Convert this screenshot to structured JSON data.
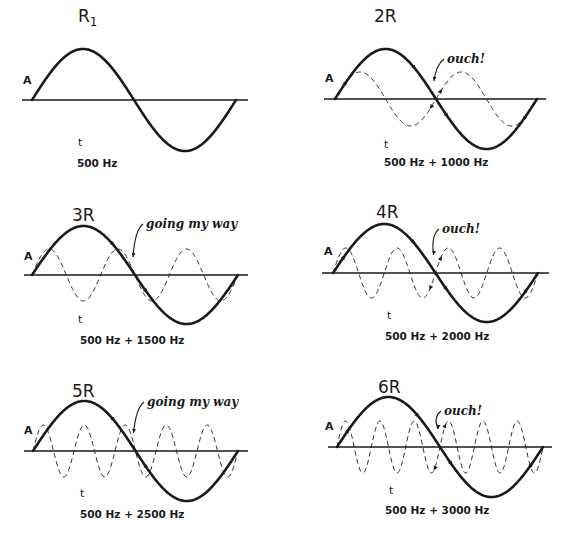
{
  "figure": {
    "background": "#ffffff",
    "ink_color": "#1a1a1a",
    "axis_labels": {
      "amplitude": "A",
      "time": "t"
    },
    "panels": [
      {
        "id": "r1",
        "title": "R",
        "title_subscript": "1",
        "frequency_label": "500 Hz",
        "fundamental_hz": 500,
        "harmonic_hz": null,
        "harmonic_multiple": 1,
        "annotation": "",
        "annotation_type": "none",
        "geometry": {
          "x0": 32,
          "x1": 236,
          "axis_y": 100,
          "axis_x0": 22,
          "axis_x1": 248,
          "amp": 51,
          "harm_amp": 0,
          "title_x": 78,
          "title_y": 22,
          "a_x": 23,
          "a_y": 84,
          "t_x": 78,
          "t_y": 146,
          "freq_x": 77,
          "freq_y": 167
        }
      },
      {
        "id": "r2",
        "title": "2R",
        "title_subscript": "",
        "frequency_label": "500 Hz + 1000 Hz",
        "fundamental_hz": 500,
        "harmonic_hz": 1000,
        "harmonic_multiple": 2,
        "annotation": "ouch!",
        "annotation_type": "opposing",
        "geometry": {
          "x0": 335,
          "x1": 537,
          "axis_y": 99,
          "axis_x0": 324,
          "axis_x1": 546,
          "amp": 50,
          "harm_amp": 27,
          "title_x": 374,
          "title_y": 22,
          "a_x": 325,
          "a_y": 82,
          "t_x": 384,
          "t_y": 148,
          "freq_x": 384,
          "freq_y": 166,
          "note_x": 447,
          "note_y": 63
        }
      },
      {
        "id": "r3",
        "title": "3R",
        "title_subscript": "",
        "frequency_label": "500 Hz + 1500 Hz",
        "fundamental_hz": 500,
        "harmonic_hz": 1500,
        "harmonic_multiple": 3,
        "annotation": "going my way",
        "annotation_type": "aligned",
        "geometry": {
          "x0": 32,
          "x1": 238,
          "axis_y": 275,
          "axis_x0": 24,
          "axis_x1": 248,
          "amp": 49,
          "harm_amp": 26,
          "title_x": 72,
          "title_y": 221,
          "a_x": 24,
          "a_y": 260,
          "t_x": 78,
          "t_y": 323,
          "freq_x": 80,
          "freq_y": 344,
          "note_x": 146,
          "note_y": 228
        }
      },
      {
        "id": "r4",
        "title": "4R",
        "title_subscript": "",
        "frequency_label": "500 Hz + 2000 Hz",
        "fundamental_hz": 500,
        "harmonic_hz": 2000,
        "harmonic_multiple": 4,
        "annotation": "ouch!",
        "annotation_type": "opposing",
        "geometry": {
          "x0": 333,
          "x1": 538,
          "axis_y": 273,
          "axis_x0": 322,
          "axis_x1": 549,
          "amp": 49,
          "harm_amp": 25,
          "title_x": 376,
          "title_y": 218,
          "a_x": 324,
          "a_y": 255,
          "t_x": 387,
          "t_y": 319,
          "freq_x": 385,
          "freq_y": 340,
          "note_x": 442,
          "note_y": 233
        }
      },
      {
        "id": "r5",
        "title": "5R",
        "title_subscript": "",
        "frequency_label": "500 Hz + 2500 Hz",
        "fundamental_hz": 500,
        "harmonic_hz": 2500,
        "harmonic_multiple": 5,
        "annotation": "going my way",
        "annotation_type": "aligned",
        "geometry": {
          "x0": 33,
          "x1": 238,
          "axis_y": 451,
          "axis_x0": 24,
          "axis_x1": 248,
          "amp": 50,
          "harm_amp": 26,
          "title_x": 72,
          "title_y": 397,
          "a_x": 24,
          "a_y": 434,
          "t_x": 80,
          "t_y": 497,
          "freq_x": 80,
          "freq_y": 518,
          "note_x": 147,
          "note_y": 406
        }
      },
      {
        "id": "r6",
        "title": "6R",
        "title_subscript": "",
        "frequency_label": "500 Hz + 3000 Hz",
        "fundamental_hz": 500,
        "harmonic_hz": 3000,
        "harmonic_multiple": 6,
        "annotation": "ouch!",
        "annotation_type": "opposing",
        "geometry": {
          "x0": 337,
          "x1": 543,
          "axis_y": 447,
          "axis_x0": 328,
          "axis_x1": 552,
          "amp": 50,
          "harm_amp": 26,
          "title_x": 378,
          "title_y": 393,
          "a_x": 325,
          "a_y": 430,
          "t_x": 389,
          "t_y": 494,
          "freq_x": 385,
          "freq_y": 514,
          "note_x": 444,
          "note_y": 415
        }
      }
    ]
  }
}
